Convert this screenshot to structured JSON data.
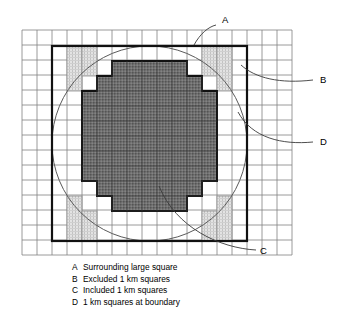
{
  "figure": {
    "type": "diagram",
    "grid": {
      "cell_size_px": 15,
      "origin_x": 22,
      "origin_y": 30,
      "cols": 18,
      "rows": 15,
      "line_color": "#777777",
      "line_width": 0.8
    },
    "large_square": {
      "label_key": "A",
      "col_start": 2,
      "row_start": 1,
      "cols": 13,
      "rows": 13,
      "stroke_color": "#111111",
      "stroke_width": 2.1,
      "fill": "none"
    },
    "circle": {
      "center_col": 8.5,
      "center_row": 7.5,
      "radius_cells": 6.5,
      "stroke_color": "#555555",
      "stroke_width": 1.0,
      "fill": "none"
    },
    "included_squares": {
      "label_key": "C",
      "fill_color": "#6e6e6e",
      "hatch_color": "#4a4a4a",
      "stroke_color": "#111111",
      "stroke_width": 1.8,
      "row_spans": [
        {
          "row": 2,
          "from": 5,
          "to": 12
        },
        {
          "row": 3,
          "from": 4,
          "to": 13
        },
        {
          "row": 4,
          "from": 3,
          "to": 14
        },
        {
          "row": 5,
          "from": 3,
          "to": 14
        },
        {
          "row": 6,
          "from": 2,
          "to": 15
        },
        {
          "row": 7,
          "from": 2,
          "to": 15
        },
        {
          "row": 8,
          "from": 2,
          "to": 15
        },
        {
          "row": 9,
          "from": 2,
          "to": 15
        },
        {
          "row": 10,
          "from": 3,
          "to": 14
        },
        {
          "row": 11,
          "from": 3,
          "to": 14
        },
        {
          "row": 12,
          "from": 4,
          "to": 13
        },
        {
          "row": 13,
          "from": 5,
          "to": 12
        }
      ]
    },
    "excluded_squares": {
      "label_key": "B",
      "fill_color": "#d4d4d4",
      "hatch_color": "#b5b5b5",
      "stroke_color": "#8a8a8a",
      "stroke_width": 0.8,
      "blocks": [
        {
          "col": 3,
          "row": 1,
          "cols": 1,
          "rows": 3
        },
        {
          "col": 4,
          "row": 1,
          "cols": 1,
          "rows": 2
        },
        {
          "col": 12,
          "row": 1,
          "cols": 1,
          "rows": 2
        },
        {
          "col": 13,
          "row": 1,
          "cols": 1,
          "rows": 3
        },
        {
          "col": 3,
          "row": 11,
          "cols": 1,
          "rows": 3
        },
        {
          "col": 4,
          "row": 12,
          "cols": 1,
          "rows": 2
        },
        {
          "col": 12,
          "row": 12,
          "cols": 1,
          "rows": 2
        },
        {
          "col": 13,
          "row": 11,
          "cols": 1,
          "rows": 3
        }
      ]
    },
    "boundary_squares": {
      "label_key": "D",
      "description": "1 km squares at boundary"
    },
    "callouts": [
      {
        "key": "A",
        "x": 222,
        "y": 23
      },
      {
        "key": "B",
        "x": 322,
        "y": 79
      },
      {
        "key": "D",
        "x": 322,
        "y": 141
      },
      {
        "key": "C",
        "x": 262,
        "y": 252
      }
    ]
  },
  "legend": {
    "items": [
      {
        "key": "A",
        "text": "Surrounding large square"
      },
      {
        "key": "B",
        "text": "Excluded 1 km squares"
      },
      {
        "key": "C",
        "text": "Included 1 km squares"
      },
      {
        "key": "D",
        "text": "1 km squares at boundary"
      }
    ]
  }
}
